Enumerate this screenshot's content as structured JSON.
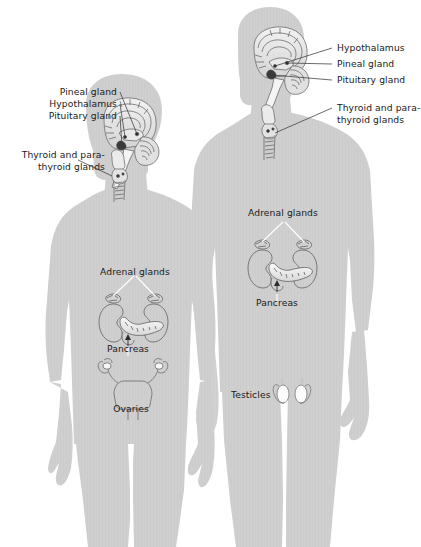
{
  "figure": {
    "background_color": "#ffffff",
    "body_color": "#cfcfcf",
    "body_edge_color": "#c4c4c4",
    "leader_line_color": "#3a3a3a",
    "label_text_color": "#1a1a1a",
    "organ_outline_color": "#5a5a5a"
  },
  "female": {
    "name": "female-figure",
    "labels": {
      "pineal_gland": "Pineal gland",
      "hypothalamus": "Hypothalamus",
      "pituitary_gland": "Pituitary gland",
      "thyroid_line1": "Thyroid and para-",
      "thyroid_line2": "thyroid glands",
      "adrenal_glands": "Adrenal glands",
      "pancreas": "Pancreas",
      "ovaries": "Ovaries"
    }
  },
  "male": {
    "name": "male-figure",
    "labels": {
      "hypothalamus": "Hypothalamus",
      "pineal_gland": "Pineal gland",
      "pituitary_gland": "Pituitary gland",
      "thyroid_line1": "Thyroid and para-",
      "thyroid_line2": "thyroid glands",
      "adrenal_glands": "Adrenal glands",
      "pancreas": "Pancreas",
      "testicles": "Testicles"
    }
  }
}
